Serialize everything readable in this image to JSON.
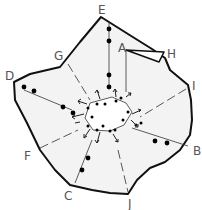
{
  "diagram": {
    "type": "radial-network-on-region",
    "labels": [
      {
        "id": "E",
        "text": "E",
        "x": 101,
        "y": 14
      },
      {
        "id": "A",
        "text": "A",
        "x": 120,
        "y": 52
      },
      {
        "id": "H",
        "text": "H",
        "x": 168,
        "y": 58
      },
      {
        "id": "I",
        "text": "I",
        "x": 193,
        "y": 88
      },
      {
        "id": "G",
        "text": "G",
        "x": 55,
        "y": 58
      },
      {
        "id": "D",
        "text": "D",
        "x": 6,
        "y": 80
      },
      {
        "id": "F",
        "text": "F",
        "x": 25,
        "y": 158
      },
      {
        "id": "B",
        "text": "B",
        "x": 194,
        "y": 152
      },
      {
        "id": "C",
        "text": "C",
        "x": 65,
        "y": 198
      },
      {
        "id": "J",
        "text": "J",
        "x": 128,
        "y": 207
      }
    ],
    "colors": {
      "outline": "#111111",
      "fill": "#f3f3f3",
      "label": "#555555",
      "dot": "#000000"
    }
  }
}
